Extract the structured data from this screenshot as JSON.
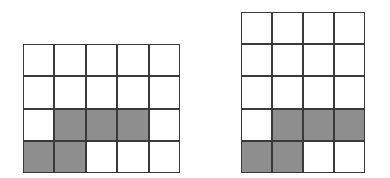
{
  "colors": {
    "grid_line": "#3a3a3a",
    "cell_empty": "#ffffff",
    "cell_shaded": "#8e8e8e",
    "background": "#ffffff"
  },
  "grids": [
    {
      "id": "left",
      "rows": 4,
      "cols": 5,
      "cells": [
        [
          0,
          0,
          0,
          0,
          0
        ],
        [
          0,
          0,
          0,
          0,
          0
        ],
        [
          0,
          1,
          1,
          1,
          0
        ],
        [
          1,
          1,
          0,
          0,
          0
        ]
      ]
    },
    {
      "id": "right",
      "rows": 5,
      "cols": 4,
      "cells": [
        [
          0,
          0,
          0,
          0
        ],
        [
          0,
          0,
          0,
          0
        ],
        [
          0,
          0,
          0,
          0
        ],
        [
          0,
          1,
          1,
          1
        ],
        [
          1,
          1,
          0,
          0
        ]
      ]
    }
  ]
}
